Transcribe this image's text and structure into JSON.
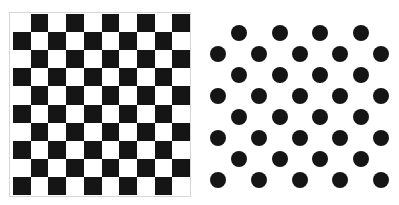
{
  "checkerboard": {
    "rows": 10,
    "cols": 10,
    "top_left_color": "white",
    "colors": {
      "dark": "#151515",
      "light": "#ffffff",
      "border": "#d6d6d6"
    }
  },
  "dot_pattern": {
    "dot_color": "#151515",
    "dot_radius": 8,
    "rows": [
      {
        "y": 33,
        "xs": [
          239,
          280,
          320,
          361
        ]
      },
      {
        "y": 54,
        "xs": [
          218,
          259,
          300,
          340,
          381
        ]
      },
      {
        "y": 75,
        "xs": [
          239,
          280,
          320,
          361
        ]
      },
      {
        "y": 96,
        "xs": [
          218,
          259,
          300,
          340,
          381
        ]
      },
      {
        "y": 117,
        "xs": [
          239,
          280,
          320,
          361
        ]
      },
      {
        "y": 138,
        "xs": [
          218,
          259,
          300,
          340,
          381
        ]
      },
      {
        "y": 159,
        "xs": [
          239,
          280,
          320,
          361
        ]
      },
      {
        "y": 180,
        "xs": [
          218,
          259,
          300,
          340,
          381
        ]
      }
    ]
  }
}
